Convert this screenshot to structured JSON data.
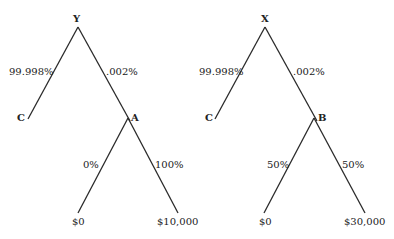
{
  "trees": [
    {
      "root": "Y",
      "branches": [
        {
          "prob": "99.998%",
          "outcome": "C"
        },
        {
          "prob": ".002%",
          "outcome": "A"
        }
      ],
      "sub_node": "A",
      "sub_branches": [
        {
          "prob": "0%",
          "payoff": "$0"
        },
        {
          "prob": "100%",
          "payoff": "$10,000"
        }
      ]
    },
    {
      "root": "X",
      "branches": [
        {
          "prob": "99.998%",
          "outcome": "C"
        },
        {
          "prob": ".002%",
          "outcome": "B"
        }
      ],
      "sub_node": "B",
      "sub_branches": [
        {
          "prob": "50%",
          "payoff": "$0"
        },
        {
          "prob": "50%",
          "payoff": "$30,000"
        }
      ]
    }
  ],
  "colors": {
    "line": "#2a2a2a",
    "text": "#222222",
    "background": "#ffffff"
  }
}
